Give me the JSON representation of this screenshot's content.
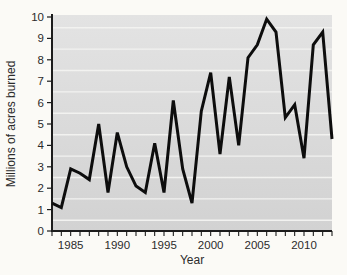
{
  "figure": {
    "colors": {
      "figure_background": "#fbfaf6",
      "plot_bg_top": "#e3e3e3",
      "plot_bg_bottom": "#d2d2d2",
      "gridline": "#f2f2f0",
      "axis": "#1c1c1c",
      "line": "#0d0d0d",
      "text": "#2b2b2b"
    }
  },
  "chart_data": {
    "type": "line",
    "title": "",
    "xlabel": "Year",
    "ylabel": "Millions of acres burned",
    "xlim": [
      1983,
      2013
    ],
    "ylim": [
      0,
      10
    ],
    "x_major_ticks": [
      1985,
      1990,
      1995,
      2000,
      2005,
      2010
    ],
    "x_minor_tick_step": 1,
    "y_ticks": [
      0,
      1,
      2,
      3,
      4,
      5,
      6,
      7,
      8,
      9,
      10
    ],
    "grid": "horizontal white lines midway between integer y-ticks",
    "legend": "none",
    "x": [
      1983,
      1984,
      1985,
      1986,
      1987,
      1988,
      1989,
      1990,
      1991,
      1992,
      1993,
      1994,
      1995,
      1996,
      1997,
      1998,
      1999,
      2000,
      2001,
      2002,
      2003,
      2004,
      2005,
      2006,
      2007,
      2008,
      2009,
      2010,
      2011,
      2012,
      2013
    ],
    "values": [
      1.3,
      1.1,
      2.9,
      2.7,
      2.4,
      5.0,
      1.8,
      4.6,
      3.0,
      2.1,
      1.8,
      4.1,
      1.8,
      6.1,
      2.9,
      1.3,
      5.6,
      7.4,
      3.6,
      7.2,
      4.0,
      8.1,
      8.7,
      9.9,
      9.3,
      5.3,
      5.9,
      3.4,
      8.7,
      9.3,
      4.3
    ]
  }
}
